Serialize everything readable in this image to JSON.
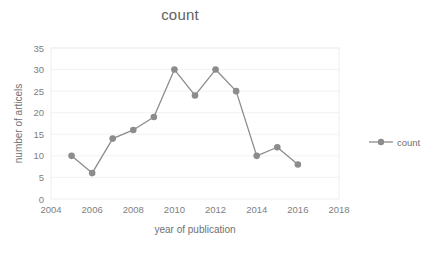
{
  "chart_data": {
    "type": "line",
    "title": "count",
    "xlabel": "year of publication",
    "ylabel": "number of articels",
    "x": [
      2005,
      2006,
      2007,
      2008,
      2009,
      2010,
      2011,
      2012,
      2013,
      2014,
      2015,
      2016
    ],
    "values": [
      10,
      6,
      14,
      16,
      19,
      30,
      24,
      30,
      25,
      10,
      12,
      8
    ],
    "series": [
      {
        "name": "count",
        "values": [
          10,
          6,
          14,
          16,
          19,
          30,
          24,
          30,
          25,
          10,
          12,
          8
        ]
      }
    ],
    "xlim": [
      2004,
      2018
    ],
    "ylim": [
      0,
      35
    ],
    "xticks": [
      "2004",
      "2006",
      "2008",
      "2010",
      "2012",
      "2014",
      "2016",
      "2018"
    ],
    "xtick_values": [
      2004,
      2006,
      2008,
      2010,
      2012,
      2014,
      2016,
      2018
    ],
    "yticks": [
      "0",
      "5",
      "10",
      "15",
      "20",
      "25",
      "30",
      "35"
    ],
    "ytick_values": [
      0,
      5,
      10,
      15,
      20,
      25,
      30,
      35
    ],
    "grid": "horizontal",
    "legend_position": "right",
    "series_color": "#8c8c8c",
    "marker": "circle"
  },
  "legend": {
    "entries": [
      {
        "label": "count",
        "color": "#8c8c8c",
        "marker": "circle-marker"
      }
    ]
  }
}
